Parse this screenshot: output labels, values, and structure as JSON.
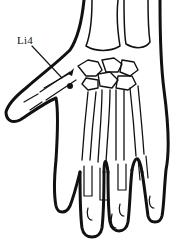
{
  "figure": {
    "point_label": "Li4",
    "line_color": "#111111",
    "background": "#ffffff"
  }
}
